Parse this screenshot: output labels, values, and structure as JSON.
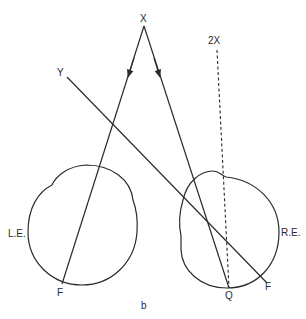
{
  "figure": {
    "panel_label": "b",
    "points": {
      "x": "X",
      "y": "Y",
      "two_x": "2X",
      "f_left": "F",
      "f_right": "F",
      "q": "Q"
    },
    "eyes": {
      "left": "L.E.",
      "right": "R.E."
    },
    "colors": {
      "line": "#2b2b2b",
      "background": "#ffffff"
    }
  }
}
